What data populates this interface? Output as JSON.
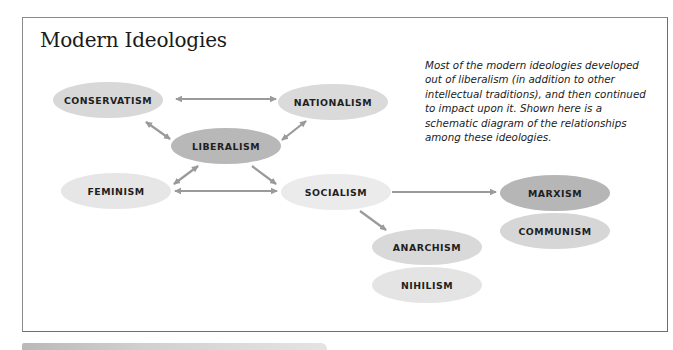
{
  "figure": {
    "title": "Modern Ideologies",
    "caption": "Most of the modern ideologies developed out of liberalism (in addition to other intellectual traditions), and then continued to impact upon it. Shown here is a schematic diagram of the relationships among these ideologies."
  },
  "nodes": {
    "conservatism": {
      "label": "CONSERVATISM",
      "color": "#d8d8d8"
    },
    "nationalism": {
      "label": "NATIONALISM",
      "color": "#dadada"
    },
    "liberalism": {
      "label": "LIBERALISM",
      "color": "#b8b8b8"
    },
    "feminism": {
      "label": "FEMINISM",
      "color": "#e6e6e6"
    },
    "socialism": {
      "label": "SOCIALISM",
      "color": "#ebebeb"
    },
    "marxism": {
      "label": "MARXISM",
      "color": "#b6b6b6"
    },
    "communism": {
      "label": "COMMUNISM",
      "color": "#d6d6d6"
    },
    "anarchism": {
      "label": "ANARCHISM",
      "color": "#d9d9d9"
    },
    "nihilism": {
      "label": "NIHILISM",
      "color": "#e4e4e4"
    }
  },
  "edges": [
    {
      "from": "CONSERVATISM",
      "to": "NATIONALISM",
      "direction": "both"
    },
    {
      "from": "CONSERVATISM",
      "to": "LIBERALISM",
      "direction": "both"
    },
    {
      "from": "NATIONALISM",
      "to": "LIBERALISM",
      "direction": "both"
    },
    {
      "from": "LIBERALISM",
      "to": "FEMINISM",
      "direction": "both"
    },
    {
      "from": "LIBERALISM",
      "to": "SOCIALISM",
      "direction": "forward"
    },
    {
      "from": "FEMINISM",
      "to": "SOCIALISM",
      "direction": "both"
    },
    {
      "from": "SOCIALISM",
      "to": "MARXISM",
      "direction": "forward"
    },
    {
      "from": "SOCIALISM",
      "to": "ANARCHISM",
      "direction": "forward"
    }
  ],
  "colors": {
    "arrow": "#9a9a9a",
    "border": "#7a7a7a"
  }
}
